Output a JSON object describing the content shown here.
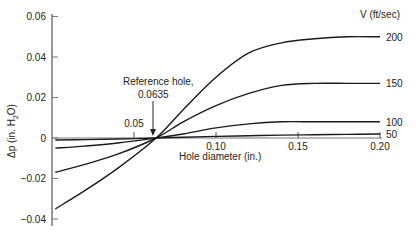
{
  "chart_data": {
    "type": "line",
    "title": "",
    "xlabel": "Hole diameter (in.)",
    "ylabel": "Δp (in. H2O)",
    "ylabel_parts": {
      "main": "Δp (in. H",
      "sub": "2",
      "tail": "O)"
    },
    "xlim": [
      0.0,
      0.2
    ],
    "ylim": [
      -0.04,
      0.06
    ],
    "x_ticks": [
      0.05,
      0.1,
      0.15,
      0.2
    ],
    "x_tick_labels": [
      "0.05",
      "0.10",
      "0.15",
      "0.20"
    ],
    "y_ticks": [
      0.06,
      0.04,
      0.02,
      0,
      -0.02,
      -0.04
    ],
    "y_tick_labels": [
      "0.06",
      "0.04",
      "0.02",
      "0",
      "−0.02",
      "−0.04"
    ],
    "grid": false,
    "legend_title": "V (ft/sec)",
    "legend_position": "right, labels at curve ends",
    "annotation": {
      "text_line1": "Reference hole,",
      "text_line2": "0.0635",
      "x": 0.0635,
      "y": 0
    },
    "series": [
      {
        "name": "200",
        "x": [
          0.0,
          0.02,
          0.04,
          0.0635,
          0.08,
          0.1,
          0.12,
          0.14,
          0.16,
          0.18,
          0.2
        ],
        "values": [
          -0.035,
          -0.026,
          -0.015,
          0.0,
          0.014,
          0.03,
          0.042,
          0.047,
          0.049,
          0.05,
          0.05
        ]
      },
      {
        "name": "150",
        "x": [
          0.0,
          0.02,
          0.04,
          0.0635,
          0.08,
          0.1,
          0.12,
          0.14,
          0.16,
          0.18,
          0.2
        ],
        "values": [
          -0.017,
          -0.013,
          -0.008,
          0.0,
          0.008,
          0.016,
          0.022,
          0.026,
          0.027,
          0.027,
          0.027
        ]
      },
      {
        "name": "100",
        "x": [
          0.0,
          0.02,
          0.04,
          0.0635,
          0.08,
          0.1,
          0.12,
          0.14,
          0.16,
          0.18,
          0.2
        ],
        "values": [
          -0.005,
          -0.004,
          -0.0025,
          0.0,
          0.002,
          0.005,
          0.007,
          0.008,
          0.008,
          0.008,
          0.008
        ]
      },
      {
        "name": "50",
        "x": [
          0.0,
          0.02,
          0.04,
          0.0635,
          0.08,
          0.1,
          0.12,
          0.14,
          0.16,
          0.18,
          0.2
        ],
        "values": [
          -0.001,
          -0.0008,
          -0.0005,
          0.0,
          0.0004,
          0.0008,
          0.0011,
          0.0014,
          0.0016,
          0.0018,
          0.002
        ]
      }
    ]
  }
}
